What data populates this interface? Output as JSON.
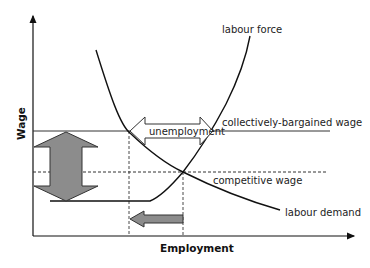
{
  "diagram": {
    "axes": {
      "x_label": "Employment",
      "y_label": "Wage"
    },
    "curves": {
      "labour_force": "labour force",
      "labour_demand": "labour demand"
    },
    "levels": {
      "collective_wage": "collectively-bargained wage",
      "competitive_wage": "competitive wage"
    },
    "annotations": {
      "unemployment": "unemployment"
    },
    "colors": {
      "line": "#111111",
      "arrow_fill": "#8c8c8c",
      "arrow_stroke": "#333333"
    }
  }
}
